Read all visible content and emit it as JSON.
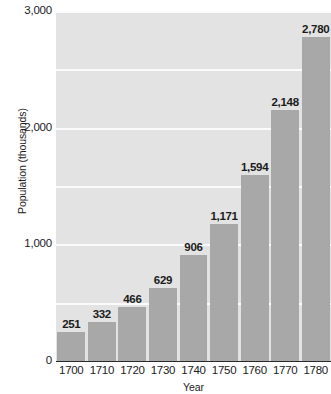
{
  "chart_data": {
    "type": "bar",
    "title": "",
    "xlabel": "Year",
    "ylabel": "Population (thousands)",
    "categories": [
      "1700",
      "1710",
      "1720",
      "1730",
      "1740",
      "1750",
      "1760",
      "1770",
      "1780"
    ],
    "values": [
      251,
      332,
      466,
      629,
      906,
      1171,
      1594,
      2148,
      2780
    ],
    "data_labels": [
      "251",
      "332",
      "466",
      "629",
      "906",
      "1,171",
      "1,594",
      "2,148",
      "2,780"
    ],
    "ylim": [
      0,
      3000
    ],
    "y_tick_labels": [
      "0",
      "1,000",
      "2,000",
      "3,000"
    ],
    "y_tick_values": [
      0,
      1000,
      2000,
      3000
    ],
    "gridline_values": [
      500,
      1000,
      1500,
      2000,
      2500,
      3000
    ],
    "grid": true,
    "legend": "none",
    "colors": {
      "bar": "#a8a8a8",
      "plot_background": "#e3e3e3",
      "gridline": "#fbfbfb",
      "axis": "#2a2a2a",
      "text": "#1b1b1b"
    }
  }
}
